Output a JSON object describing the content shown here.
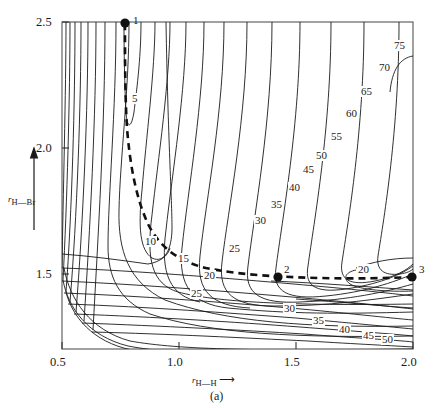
{
  "figure": {
    "caption": "(a)",
    "background_color": "#ffffff",
    "line_color": "#1a1a1a"
  },
  "axes": {
    "x": {
      "label_prefix": "r",
      "label_sub": "H—H",
      "label_arrow": "⟶",
      "ticks": [
        "0.5",
        "1.0",
        "1.5",
        "2.0"
      ],
      "range": [
        0.5,
        2.0
      ]
    },
    "y": {
      "label_prefix": "r",
      "label_sub": "H—Br",
      "label_arrow": "↑",
      "ticks": [
        "2.5",
        "2.0",
        "1.5"
      ],
      "range": [
        1.2,
        2.5
      ]
    }
  },
  "points": [
    {
      "name": "point-1",
      "label": "1",
      "x": 0.76,
      "y": 2.5
    },
    {
      "name": "point-2",
      "label": "2",
      "x": 1.35,
      "y": 1.38
    },
    {
      "name": "point-3",
      "label": "3",
      "x": 2.0,
      "y": 1.35
    }
  ],
  "contour_labels": [
    {
      "text": "5",
      "px": 131,
      "py": 93
    },
    {
      "text": "10",
      "px": 144,
      "py": 236
    },
    {
      "text": "15",
      "px": 177,
      "py": 253
    },
    {
      "text": "20",
      "px": 203,
      "py": 270
    },
    {
      "text": "25",
      "px": 190,
      "py": 288
    },
    {
      "text": "20",
      "px": 357,
      "py": 264
    },
    {
      "text": "25",
      "px": 228,
      "py": 243
    },
    {
      "text": "30",
      "px": 254,
      "py": 215
    },
    {
      "text": "35",
      "px": 270,
      "py": 199
    },
    {
      "text": "40",
      "px": 288,
      "py": 182
    },
    {
      "text": "45",
      "px": 302,
      "py": 164
    },
    {
      "text": "50",
      "px": 315,
      "py": 150
    },
    {
      "text": "55",
      "px": 330,
      "py": 131
    },
    {
      "text": "60",
      "px": 345,
      "py": 108
    },
    {
      "text": "65",
      "px": 360,
      "py": 86
    },
    {
      "text": "70",
      "px": 378,
      "py": 62
    },
    {
      "text": "75",
      "px": 393,
      "py": 40
    },
    {
      "text": "30",
      "px": 283,
      "py": 303
    },
    {
      "text": "35",
      "px": 312,
      "py": 315
    },
    {
      "text": "40",
      "px": 338,
      "py": 324
    },
    {
      "text": "45",
      "px": 362,
      "py": 330
    },
    {
      "text": "50",
      "px": 381,
      "py": 334
    }
  ],
  "chart_data": {
    "type": "contour",
    "title": "",
    "subtitle": "",
    "xlabel": "r_H—H",
    "ylabel": "r_H—Br",
    "xlim": [
      0.5,
      2.0
    ],
    "ylim": [
      1.2,
      2.5
    ],
    "xticks": [
      0.5,
      1.0,
      1.5,
      2.0
    ],
    "yticks": [
      1.5,
      2.0,
      2.5
    ],
    "grid": false,
    "legend": "none",
    "contour_levels": [
      5,
      10,
      15,
      20,
      25,
      30,
      35,
      40,
      45,
      50,
      55,
      60,
      65,
      70,
      75
    ],
    "annotations": [
      {
        "label": "1",
        "x": 0.76,
        "y": 2.5,
        "marker": "filled-circle"
      },
      {
        "label": "2",
        "x": 1.35,
        "y": 1.38,
        "marker": "filled-circle"
      },
      {
        "label": "3",
        "x": 2.0,
        "y": 1.35,
        "marker": "filled-circle"
      }
    ],
    "reaction_path": {
      "style": "dashed",
      "points": [
        [
          0.76,
          2.5
        ],
        [
          0.76,
          2.22
        ],
        [
          0.78,
          2.0
        ],
        [
          0.8,
          1.82
        ],
        [
          0.84,
          1.66
        ],
        [
          0.9,
          1.54
        ],
        [
          0.98,
          1.47
        ],
        [
          1.08,
          1.43
        ],
        [
          1.2,
          1.4
        ],
        [
          1.35,
          1.38
        ],
        [
          1.55,
          1.37
        ],
        [
          1.75,
          1.36
        ],
        [
          2.0,
          1.35
        ]
      ]
    }
  }
}
